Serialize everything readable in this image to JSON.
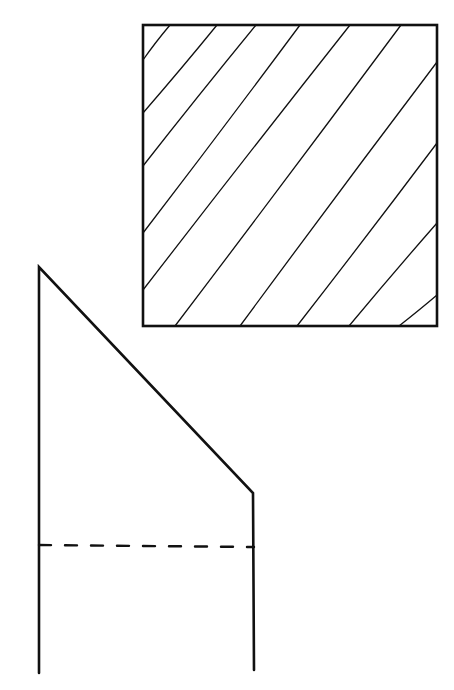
{
  "diagram": {
    "type": "orthographic-technical-drawing",
    "background": "#ffffff",
    "ink_color": "#111111",
    "views": [
      {
        "id": "section-view",
        "kind": "hatched-square",
        "outline": {
          "x1": 143,
          "y1": 25,
          "x2": 437,
          "y2": 326,
          "stroke_width": 2.6
        },
        "hatch_stroke_width": 1.3,
        "hatch_lines": [
          {
            "x1": 170,
            "y1": 25,
            "x2": 143,
            "y2": 60
          },
          {
            "x1": 217,
            "y1": 25,
            "x2": 143,
            "y2": 113
          },
          {
            "x1": 256,
            "y1": 25,
            "x2": 143,
            "y2": 166
          },
          {
            "x1": 300,
            "y1": 25,
            "x2": 143,
            "y2": 233
          },
          {
            "x1": 350,
            "y1": 25,
            "x2": 143,
            "y2": 290
          },
          {
            "x1": 401,
            "y1": 25,
            "x2": 175,
            "y2": 326
          },
          {
            "x1": 437,
            "y1": 62,
            "x2": 240,
            "y2": 326
          },
          {
            "x1": 437,
            "y1": 143,
            "x2": 297,
            "y2": 326
          },
          {
            "x1": 437,
            "y1": 223,
            "x2": 349,
            "y2": 326
          },
          {
            "x1": 437,
            "y1": 295,
            "x2": 399,
            "y2": 326
          }
        ]
      },
      {
        "id": "side-view",
        "kind": "chamfered-profile",
        "stroke_width": 2.6,
        "outline_points": [
          [
            39,
            673
          ],
          [
            39,
            267
          ],
          [
            253,
            493
          ],
          [
            254,
            670
          ]
        ],
        "hidden_line": {
          "x1": 39,
          "y1": 545,
          "x2": 254,
          "y2": 547,
          "dash": "12 14",
          "stroke_width": 2.4
        }
      }
    ],
    "labels": []
  }
}
